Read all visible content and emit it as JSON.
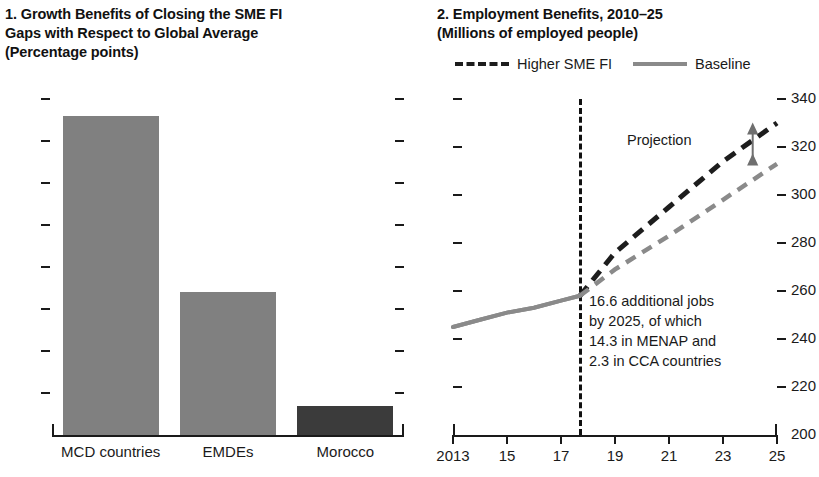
{
  "figure": {
    "panels": [
      {
        "number": "1.",
        "title": "1. Growth Benefits of Closing the SME FI\nGaps with Respect to Global Average\n(Percentage points)"
      },
      {
        "number": "2.",
        "title": "2. Employment Benefits, 2010–25\n(Millions of employed people)"
      }
    ]
  },
  "legend": {
    "items": [
      {
        "label": "Higher SME FI",
        "style": "dashed",
        "color": "#1d1d1d",
        "icon": "dashed-line-swatch"
      },
      {
        "label": "Baseline",
        "style": "solid",
        "color": "#8a8a8a",
        "icon": "solid-line-swatch"
      }
    ]
  },
  "annotations": {
    "jobs": "16.6 additional jobs\nby 2025, of which\n14.3 in MENAP and\n2.3 in CCA countries",
    "projection": "Projection"
  },
  "colors": {
    "bar_grey": "#808080",
    "bar_dark": "#3b3b3b",
    "baseline_line": "#8a8a8a",
    "higher_fi_line": "#1d1d1d",
    "axis": "#1a1a1a"
  },
  "chart_data": [
    {
      "type": "bar",
      "panel": 1,
      "title": "1. Growth Benefits of Closing the SME FI Gaps with Respect to Global Average",
      "subtitle": "(Percentage points)",
      "xlabel": "",
      "ylabel": "",
      "categories": [
        "MCD countries",
        "EMDEs",
        "Morocco"
      ],
      "values": [
        1.52,
        0.68,
        0.14
      ],
      "bar_colors": [
        "#808080",
        "#808080",
        "#3b3b3b"
      ],
      "ylim": [
        0,
        1.6
      ],
      "yticks": [
        0,
        0.2,
        0.4,
        0.6,
        0.8,
        1,
        1.2,
        1.4,
        1.6
      ],
      "ytick_labels": [
        "0",
        "0.2",
        "0.4",
        "0.6",
        "0.8",
        "1",
        "1.2",
        "1.4",
        "1.6"
      ],
      "grid": false,
      "legend": "none"
    },
    {
      "type": "line",
      "panel": 2,
      "title": "2. Employment Benefits, 2010–25",
      "subtitle": "(Millions of employed people)",
      "xlabel": "",
      "ylabel": "",
      "x": [
        2013,
        2014,
        2015,
        2016,
        2017,
        2017.7,
        2019,
        2021,
        2023,
        2025
      ],
      "xticks": [
        2013,
        2015,
        2017,
        2019,
        2021,
        2023,
        2025
      ],
      "xtick_labels": [
        "2013",
        "15",
        "17",
        "19",
        "21",
        "23",
        "25"
      ],
      "ylim": [
        200,
        340
      ],
      "yticks": [
        200,
        220,
        240,
        260,
        280,
        300,
        320,
        340
      ],
      "ytick_labels": [
        "200",
        "220",
        "240",
        "260",
        "280",
        "300",
        "320",
        "340"
      ],
      "yaxis_position": "right",
      "grid": false,
      "legend_position": "top",
      "projection_start": 2017.7,
      "series": [
        {
          "name": "Higher SME FI",
          "style": "dashed",
          "color": "#1d1d1d",
          "values": [
            245,
            248,
            251,
            253,
            256,
            258,
            276,
            295,
            314,
            330
          ]
        },
        {
          "name": "Baseline",
          "style": "solid-then-dashed",
          "color": "#8a8a8a",
          "values": [
            245,
            248,
            251,
            253,
            256,
            258,
            269,
            283,
            298,
            313
          ]
        }
      ],
      "annotations": [
        {
          "text": "Projection",
          "x": 2022.2,
          "y": 322
        },
        {
          "text": "16.6 additional jobs by 2025, of which 14.3 in MENAP and 2.3 in CCA countries",
          "x": 2018.3,
          "y": 262
        }
      ]
    }
  ]
}
